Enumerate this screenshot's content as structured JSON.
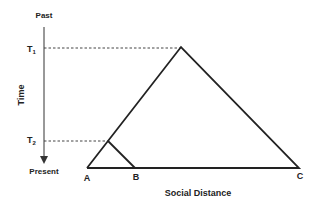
{
  "diagram": {
    "axis": {
      "top_label": "Past",
      "bottom_label": "Present",
      "title": "Time"
    },
    "time_marks": [
      {
        "label": "T",
        "sub": "1"
      },
      {
        "label": "T",
        "sub": "2"
      }
    ],
    "points": {
      "a": "A",
      "b": "B",
      "c": "C"
    },
    "x_axis_title": "Social Distance",
    "colors": {
      "line": "#222222",
      "background": "#ffffff"
    }
  }
}
